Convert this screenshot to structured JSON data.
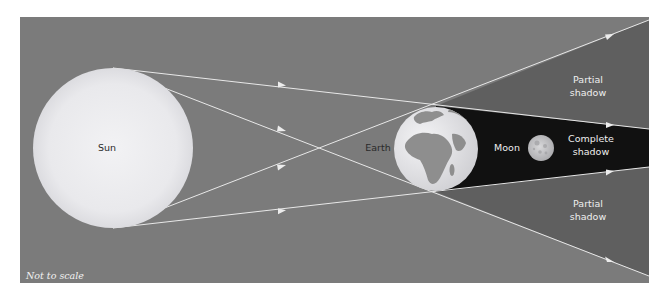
{
  "diagram": {
    "colors": {
      "background": "#7b7b7b",
      "penumbra": "#5f5f5f",
      "umbra": "#111111",
      "sun": "#ebebee",
      "earth_ocean": "#e6e6e8",
      "earth_land": "#8e8e8e",
      "moon": "#c9c9cb",
      "rays": "#e8e8e8"
    },
    "labels": {
      "sun": "Sun",
      "earth": "Earth",
      "moon": "Moon",
      "partial_top_line1": "Partial",
      "partial_top_line2": "shadow",
      "complete_line1": "Complete",
      "complete_line2": "shadow",
      "partial_bottom_line1": "Partial",
      "partial_bottom_line2": "shadow",
      "note": "Not to scale"
    },
    "bodies": [
      {
        "name": "Sun",
        "cx": 113,
        "cy": 148,
        "r": 80
      },
      {
        "name": "Earth",
        "cx": 436,
        "cy": 149,
        "r": 42
      },
      {
        "name": "Moon",
        "cx": 541,
        "cy": 148,
        "r": 13
      }
    ],
    "rays": [
      {
        "name": "ray-top-outer",
        "from": [
          113,
          68
        ],
        "to": [
          649,
          129
        ]
      },
      {
        "name": "ray-top-cross",
        "from": [
          113,
          68
        ],
        "to": [
          649,
          276
        ]
      },
      {
        "name": "ray-bottom-cross",
        "from": [
          113,
          228
        ],
        "to": [
          649,
          20
        ]
      },
      {
        "name": "ray-bottom-outer",
        "from": [
          113,
          228
        ],
        "to": [
          649,
          167
        ]
      }
    ]
  }
}
